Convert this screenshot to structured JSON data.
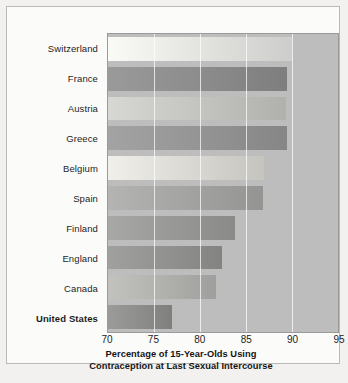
{
  "chart_data": {
    "type": "bar",
    "orientation": "horizontal",
    "title": "",
    "caption_line_1": "Percentage of 15-Year-Olds Using",
    "caption_line_2": "Contraception at Last Sexual Intercourse",
    "xlabel": "Percentage of 15-Year-Olds Using Contraception at Last Sexual Intercourse",
    "ylabel": "",
    "xlim": [
      70,
      95
    ],
    "xticks": [
      70,
      75,
      80,
      85,
      90,
      95
    ],
    "xtick_labels": [
      "70",
      "75",
      "80",
      "85",
      "90",
      "95"
    ],
    "grid": true,
    "grid_axis": "x",
    "legend": "none",
    "categories": [
      "Switzerland",
      "France",
      "Austria",
      "Greece",
      "Belgium",
      "Spain",
      "Finland",
      "England",
      "Canada",
      "United States"
    ],
    "values": [
      90.0,
      89.5,
      89.4,
      89.5,
      87.0,
      86.8,
      83.8,
      82.4,
      81.7,
      77.0
    ],
    "bars": [
      {
        "label": "Switzerland",
        "value": 90.0,
        "color": "#fafaf7",
        "highlighted": false
      },
      {
        "label": "France",
        "value": 89.5,
        "color": "#9a9a9a",
        "highlighted": false
      },
      {
        "label": "Austria",
        "value": 89.4,
        "color": "#d7d7d3",
        "highlighted": false
      },
      {
        "label": "Greece",
        "value": 89.5,
        "color": "#a3a3a3",
        "highlighted": false
      },
      {
        "label": "Belgium",
        "value": 87.0,
        "color": "#f0efe9",
        "highlighted": false
      },
      {
        "label": "Spain",
        "value": 86.8,
        "color": "#b4b4b2",
        "highlighted": false
      },
      {
        "label": "Finland",
        "value": 83.8,
        "color": "#a8a8a6",
        "highlighted": false
      },
      {
        "label": "England",
        "value": 82.4,
        "color": "#a0a09e",
        "highlighted": false
      },
      {
        "label": "Canada",
        "value": 81.7,
        "color": "#c2c2bf",
        "highlighted": false
      },
      {
        "label": "United States",
        "value": 77.0,
        "color": "#9b9b99",
        "highlighted": true
      }
    ],
    "colors": {
      "plot_background": "#bdbdbd",
      "plot_border": "#9a9a9a",
      "gridline": "#ffffff",
      "figure_background": "#fbfbfa",
      "page_background": "#f2f1ef",
      "text": "#1d1d1d"
    }
  }
}
